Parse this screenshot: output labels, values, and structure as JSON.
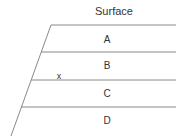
{
  "diagram": {
    "title": "Surface",
    "layers": [
      {
        "label": "A"
      },
      {
        "label": "B"
      },
      {
        "label": "C"
      },
      {
        "label": "D"
      }
    ],
    "marker": {
      "label": "x"
    },
    "colors": {
      "line": "#8a8a8a",
      "text": "#333333"
    }
  }
}
